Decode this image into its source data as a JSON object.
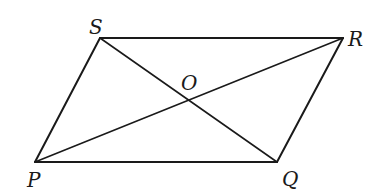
{
  "figure": {
    "type": "parallelogram-with-diagonals",
    "stroke_color": "#1a1a1a",
    "background": "#ffffff",
    "vertices": {
      "P": {
        "label": "P",
        "x": 35,
        "y": 162,
        "label_x": 27,
        "label_y": 187
      },
      "Q": {
        "label": "Q",
        "x": 277,
        "y": 162,
        "label_x": 282,
        "label_y": 186
      },
      "R": {
        "label": "R",
        "x": 343,
        "y": 38,
        "label_x": 348,
        "label_y": 46
      },
      "S": {
        "label": "S",
        "x": 100,
        "y": 38,
        "label_x": 89,
        "label_y": 34
      }
    },
    "intersection": {
      "label": "O",
      "x": 189,
      "y": 100,
      "label_x": 181,
      "label_y": 90
    },
    "sides": [
      "PQ",
      "QR",
      "RS",
      "SP"
    ],
    "diagonals": [
      "PR",
      "SQ"
    ]
  }
}
